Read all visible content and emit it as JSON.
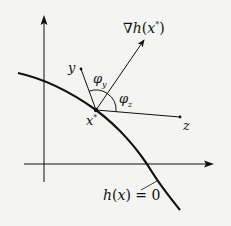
{
  "diagram": {
    "type": "constraint-gradient-geometry",
    "colors": {
      "background": "#f4f4f2",
      "ink": "#111111"
    },
    "axes": {
      "vertical": {
        "x": 44,
        "y_top": 17,
        "y_bottom": 182
      },
      "horizontal": {
        "y": 164,
        "x_left": 24,
        "x_right": 213
      }
    },
    "curve": {
      "label": "h(x) = 0",
      "points": [
        [
          18,
          73
        ],
        [
          43,
          79
        ],
        [
          96,
          110
        ],
        [
          145,
          164
        ],
        [
          180,
          210
        ]
      ]
    },
    "point": {
      "label": "x*",
      "x": 96,
      "y": 110
    },
    "vectors": [
      {
        "name": "y",
        "label": "y",
        "to": [
          81,
          69
        ],
        "arrow": false
      },
      {
        "name": "gradient",
        "label": "∇h(x*)",
        "to": [
          145,
          38
        ],
        "arrow": true
      },
      {
        "name": "z",
        "label": "z",
        "to": [
          180,
          117
        ],
        "arrow": false
      }
    ],
    "angles": [
      {
        "name": "phi_y",
        "label": "φy"
      },
      {
        "name": "phi_z",
        "label": "φz"
      }
    ],
    "labels": {
      "gradient_nabla": "∇",
      "gradient_h": "h",
      "gradient_paren_open": "(",
      "gradient_x": "x",
      "gradient_star": "*",
      "gradient_paren_close": ")",
      "y": "y",
      "z": "z",
      "xstar_x": "x",
      "xstar_star": "*",
      "phi_y_phi": "φ",
      "phi_y_sub": "y",
      "phi_z_phi": "φ",
      "phi_z_sub": "z",
      "curve_h": "h",
      "curve_open": "(",
      "curve_x": "x",
      "curve_close": ")",
      "curve_eq": " = 0"
    }
  }
}
